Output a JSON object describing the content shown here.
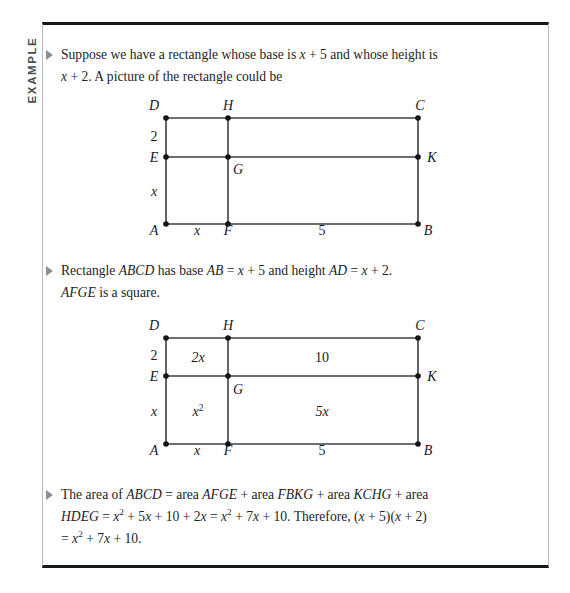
{
  "page": {
    "background": "#ffffff",
    "frame_border_color": "#14181c",
    "frame_side_color": "#b9bcc0"
  },
  "example_tab": {
    "label": "EXAMPLE",
    "color": "#4a4f55"
  },
  "bullets": {
    "marker": "triangle-right-icon",
    "marker_color": "#8a9096"
  },
  "paragraphs": {
    "p1_line1_a": "Suppose we have a rectangle whose base is ",
    "p1_x1": "x",
    "p1_plus5": " + 5",
    "p1_line1_b": " and whose height is",
    "p1_x2": "x",
    "p1_plus2": " + 2.",
    "p1_line2_b": " A picture of the rectangle could be",
    "p2_a": "Rectangle ",
    "p2_ABCD": "ABCD",
    "p2_b": " has base ",
    "p2_AB": "AB",
    "p2_c": " = ",
    "p2_x1": "x",
    "p2_d": " + 5 and height ",
    "p2_AD": "AD",
    "p2_e": " = ",
    "p2_x2": "x",
    "p2_f": " + 2.",
    "p2_AFGE": "AFGE",
    "p2_g": " is a square.",
    "p3_a": "The area of ",
    "p3_ABCD": "ABCD",
    "p3_b": " = area ",
    "p3_AFGE": "AFGE",
    "p3_c": " + area ",
    "p3_FBKG": "FBKG",
    "p3_d": " + area ",
    "p3_KCHG": "KCHG",
    "p3_e": " + area",
    "p3_HDEG": "HDEG",
    "p3_f": " = ",
    "p3_x1": "x",
    "p3_sup1": "2",
    "p3_g": " + 5",
    "p3_x2": "x",
    "p3_h": " + 10 + 2",
    "p3_x3": "x",
    "p3_i": " = ",
    "p3_x4": "x",
    "p3_sup2": "2",
    "p3_j": " + 7",
    "p3_x5": "x",
    "p3_k": " + 10. Therefore, (",
    "p3_x6": "x",
    "p3_l": " + 5)(",
    "p3_x7": "x",
    "p3_m": " + 2)",
    "p3_n": " = ",
    "p3_x8": "x",
    "p3_sup3": "2",
    "p3_o": " + 7",
    "p3_x9": "x",
    "p3_p": " + 10."
  },
  "figure1": {
    "caption": "rectangle-subdivided-unlabeled",
    "vertices": {
      "D": "D",
      "H": "H",
      "C": "C",
      "E": "E",
      "G": "G",
      "K": "K",
      "A": "A",
      "F": "F",
      "B": "B"
    },
    "side_labels": {
      "left_top": "2",
      "left_bottom": "x",
      "bottom_left": "x",
      "bottom_right": "5"
    },
    "line_color": "#3a3f45",
    "dot_color": "#111316"
  },
  "figure2": {
    "caption": "rectangle-subdivided-with-areas",
    "vertices": {
      "D": "D",
      "H": "H",
      "C": "C",
      "E": "E",
      "G": "G",
      "K": "K",
      "A": "A",
      "F": "F",
      "B": "B"
    },
    "side_labels": {
      "left_top": "2",
      "left_bottom": "x",
      "bottom_left": "x",
      "bottom_right": "5"
    },
    "areas": {
      "top_left": "2x",
      "top_right": "10",
      "bottom_left": "x",
      "bottom_left_sup": "2",
      "bottom_right": "5x"
    },
    "line_color": "#3a3f45",
    "dot_color": "#111316"
  }
}
